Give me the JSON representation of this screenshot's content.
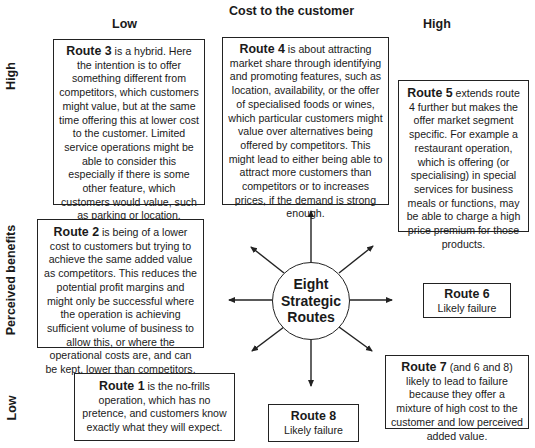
{
  "axes": {
    "x_title": "Cost to the customer",
    "x_low": "Low",
    "x_high": "High",
    "y_title": "Perceived benefits",
    "y_high": "High",
    "y_low": "Low"
  },
  "center": {
    "line1": "Eight",
    "line2": "Strategic",
    "line3": "Routes"
  },
  "routes": {
    "route3": {
      "title": "Route 3",
      "text": " is a hybrid. Here the intention is to offer something different from competitors, which customers might value, but at the same time offering this at lower cost to the customer. Limited service operations might be able to consider this especially if there is some other feature, which customers would value, such as parking or location."
    },
    "route4": {
      "title": "Route 4",
      "text": " is about attracting market share through identifying and promoting features, such as location, availability, or the offer of specialised foods or wines, which particular customers might value over alternatives being offered by competitors. This might lead to either being able to attract more customers than competitors or to increases prices, if the demand is strong enough."
    },
    "route5": {
      "title": "Route 5",
      "text": " extends route 4 further but makes the offer market segment specific. For example a restaurant operation, which is offering (or specialising) in special services for business meals or functions, may be able to charge a high price premium for those products."
    },
    "route2": {
      "title": "Route 2",
      "text": " is being of a lower cost to customers but trying to achieve the same added value as competitors. This reduces the potential profit margins and might only be successful where the operation is achieving sufficient volume of business to allow this, or where the operational costs are, and can be kept, lower than competitors."
    },
    "route1": {
      "title": "Route 1",
      "text": " is the no-frills operation, which has no pretence, and customers know exactly what they will expect."
    },
    "route6": {
      "title": "Route 6",
      "text": "Likely failure"
    },
    "route7": {
      "title": "Route 7",
      "text": " (and 6 and 8) likely to lead to failure because they offer a mixture of high cost to the customer and low perceived added value."
    },
    "route8": {
      "title": "Route 8",
      "text": "Likely failure"
    }
  },
  "colors": {
    "line": "#222222",
    "text": "#1a1a1a",
    "background": "#ffffff"
  }
}
